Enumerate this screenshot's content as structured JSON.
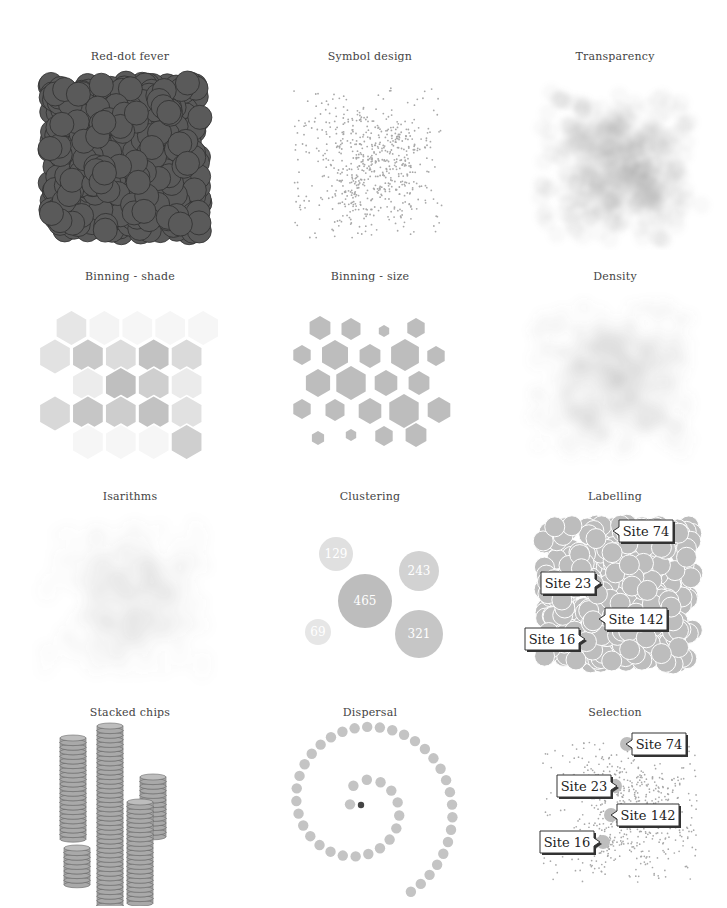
{
  "panels": [
    {
      "id": "red-dot-fever",
      "title": "Red-dot fever"
    },
    {
      "id": "symbol-design",
      "title": "Symbol design"
    },
    {
      "id": "transparency",
      "title": "Transparency"
    },
    {
      "id": "binning-shade",
      "title": "Binning - shade"
    },
    {
      "id": "binning-size",
      "title": "Binning - size"
    },
    {
      "id": "density",
      "title": "Density"
    },
    {
      "id": "isarithms",
      "title": "Isarithms"
    },
    {
      "id": "clustering",
      "title": "Clustering"
    },
    {
      "id": "labelling",
      "title": "Labelling"
    },
    {
      "id": "stacked-chips",
      "title": "Stacked chips"
    },
    {
      "id": "dispersal",
      "title": "Dispersal"
    },
    {
      "id": "selection",
      "title": "Selection"
    }
  ],
  "clustering": {
    "clusters": [
      {
        "label": "129",
        "cx": 40,
        "cy": 40,
        "r": 17,
        "color": "#e0e0e0"
      },
      {
        "label": "243",
        "cx": 123,
        "cy": 57,
        "r": 20,
        "color": "#d2d2d2"
      },
      {
        "label": "465",
        "cx": 69,
        "cy": 87,
        "r": 27,
        "color": "#bdbdbd"
      },
      {
        "label": "69",
        "cx": 22,
        "cy": 118,
        "r": 13,
        "color": "#e6e6e6"
      },
      {
        "label": "321",
        "cx": 123,
        "cy": 120,
        "r": 24,
        "color": "#c6c6c6"
      }
    ]
  },
  "labelling": {
    "labels": [
      "Site 74",
      "Site 23",
      "Site 142",
      "Site 16"
    ]
  },
  "selection": {
    "labels": [
      "Site 74",
      "Site 23",
      "Site 142",
      "Site 16"
    ]
  },
  "colors": {
    "dark_dot": "#5a5a5a",
    "dark_stroke": "#2e2e2e",
    "light_grey": "#bdbdbd",
    "title": "#444444"
  }
}
